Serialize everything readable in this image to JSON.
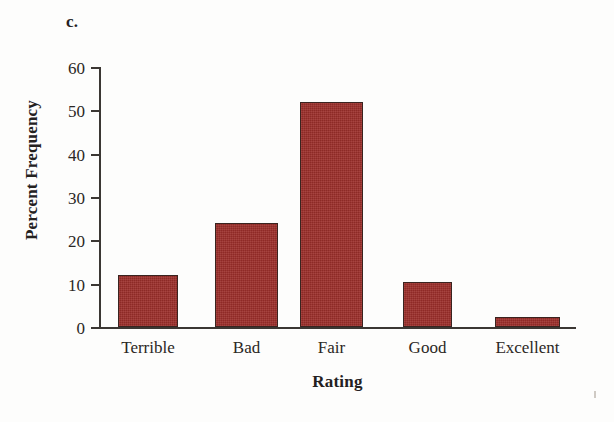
{
  "figure": {
    "panel_label": "c.",
    "background_color": "#fdfdfc"
  },
  "chart_data": {
    "type": "bar",
    "title": "",
    "subtitle": "",
    "categories": [
      "Terrible",
      "Bad",
      "Fair",
      "Good",
      "Excellent"
    ],
    "values": [
      12.0,
      24.0,
      52.0,
      10.3,
      2.3
    ],
    "xlabel": "Rating",
    "ylabel": "Percent Frequency",
    "ylim": [
      0,
      60
    ],
    "yticks": [
      0,
      10,
      20,
      30,
      40,
      50,
      60
    ],
    "ytick_labels": [
      "0",
      "10",
      "20",
      "30",
      "40",
      "50",
      "60"
    ],
    "grid": false,
    "legend": false,
    "bar_color": "#9c2e2a",
    "bar_edge_color": "#3a2420",
    "axis_color": "#3b3733"
  },
  "bars": [
    {
      "label": "Terrible",
      "value": 12.0,
      "left_px": 18,
      "width_px": 60
    },
    {
      "label": "Bad",
      "value": 24.0,
      "left_px": 115,
      "width_px": 63
    },
    {
      "label": "Fair",
      "value": 52.0,
      "left_px": 200,
      "width_px": 63
    },
    {
      "label": "Good",
      "value": 10.3,
      "left_px": 303,
      "width_px": 49
    },
    {
      "label": "Excellent",
      "value": 2.3,
      "left_px": 395,
      "width_px": 65
    }
  ],
  "axes": {
    "x_title": "Rating",
    "y_title": "Percent Frequency"
  }
}
